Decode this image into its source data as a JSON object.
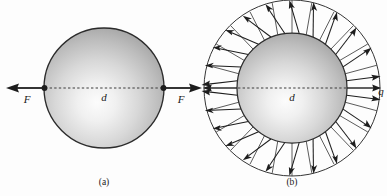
{
  "figure": {
    "background_color": "#fdfdfd",
    "ink_color": "#1d1d1d",
    "sphere_edge_color": "#2b2b2b",
    "sphere_light_color": "#fbfbfb",
    "sphere_mid_color": "#c9c9c9",
    "sphere_dark_color": "#8e8e8e"
  },
  "panel_a": {
    "caption": "(a)",
    "diameter_label": "d",
    "force_label_left": "F",
    "force_label_right": "F",
    "center_x": 104,
    "center_y": 88,
    "sphere_radius": 60,
    "arrow_tip_left_x": 8,
    "arrow_tip_right_x": 200
  },
  "panel_b": {
    "caption": "(b)",
    "diameter_label": "d",
    "charge_label": "q",
    "center_x": 292,
    "center_y": 88,
    "sphere_radius": 55,
    "outer_radius": 88,
    "arrow_count": 24,
    "divider_count": 24
  }
}
